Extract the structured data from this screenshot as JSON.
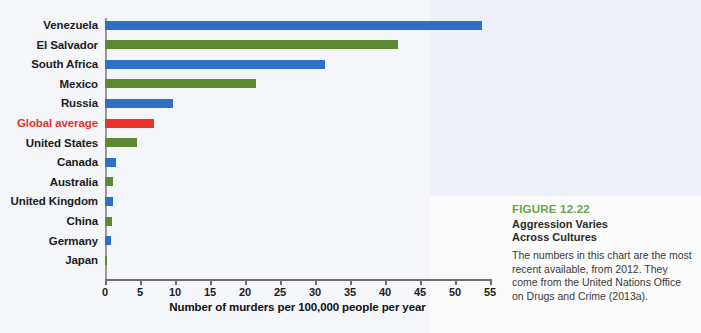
{
  "chart_data": {
    "type": "bar",
    "orientation": "horizontal",
    "title": "Aggression Varies Across Cultures",
    "xlabel": "Number of murders per 100,000 people per year",
    "ylabel": "",
    "xlim": [
      0,
      55
    ],
    "xticks": [
      0,
      5,
      10,
      15,
      20,
      25,
      30,
      35,
      40,
      45,
      50,
      55
    ],
    "grid": false,
    "legend": "none",
    "categories": [
      "Venezuela",
      "El Salvador",
      "South Africa",
      "Mexico",
      "Russia",
      "Global average",
      "United States",
      "Canada",
      "Australia",
      "United Kingdom",
      "China",
      "Germany",
      "Japan"
    ],
    "values": [
      53.8,
      41.9,
      31.4,
      21.6,
      9.7,
      7.0,
      4.6,
      1.6,
      1.2,
      1.1,
      1.0,
      0.8,
      0.3
    ],
    "bar_colors": [
      "#2f6fc4",
      "#5b8a33",
      "#2f6fc4",
      "#5b8a33",
      "#2f6fc4",
      "#e8322b",
      "#5b8a33",
      "#2f6fc4",
      "#5b8a33",
      "#2f6fc4",
      "#5b8a33",
      "#2f6fc4",
      "#5b8a33"
    ],
    "highlight_category": "Global average",
    "highlight_color": "#e8322b"
  },
  "caption": {
    "figure_number": "FIGURE 12.22",
    "title_line_1": "Aggression Varies",
    "title_line_2": "Across Cultures",
    "body": "The numbers in this chart are the most recent available, from 2012. They come from the United Nations Office on Drugs and Crime (2013a).",
    "accent_color": "#6aa344"
  }
}
